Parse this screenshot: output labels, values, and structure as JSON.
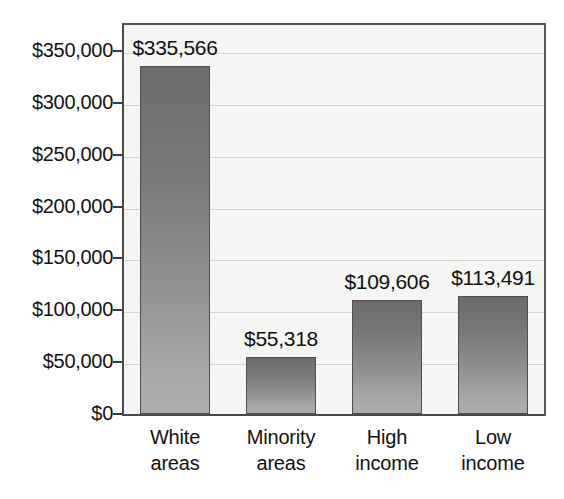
{
  "chart_data": {
    "type": "bar",
    "title": "",
    "subtitle": "",
    "xlabel": "",
    "ylabel": "",
    "categories": [
      "White areas",
      "Minority areas",
      "High income",
      "Low income"
    ],
    "category_lines": [
      [
        "White",
        "areas"
      ],
      [
        "Minority",
        "areas"
      ],
      [
        "High",
        "income"
      ],
      [
        "Low",
        "income"
      ]
    ],
    "values": [
      335566,
      55318,
      109606,
      113491
    ],
    "value_labels": [
      "$335,566",
      "$55,318",
      "$109,606",
      "$113,491"
    ],
    "ylim": [
      0,
      375000
    ],
    "ytick_values": [
      0,
      50000,
      100000,
      150000,
      200000,
      250000,
      300000,
      350000
    ],
    "ytick_labels": [
      "$0",
      "$50,000",
      "$100,000",
      "$150,000",
      "$200,000",
      "$250,000",
      "$300,000",
      "$350,000"
    ],
    "grid": true,
    "grid_axis": "y",
    "legend": false,
    "legend_position": "none",
    "colors": {
      "bar_top": "#6c6c6c",
      "bar_bottom": "#aeaeae",
      "bar_border": "#4f4f4f",
      "plot_background": "#f5f5f3",
      "gridline": "#d2d2d0",
      "axis": "#4a4a4a",
      "text": "#111111",
      "page_background": "#ffffff"
    }
  }
}
